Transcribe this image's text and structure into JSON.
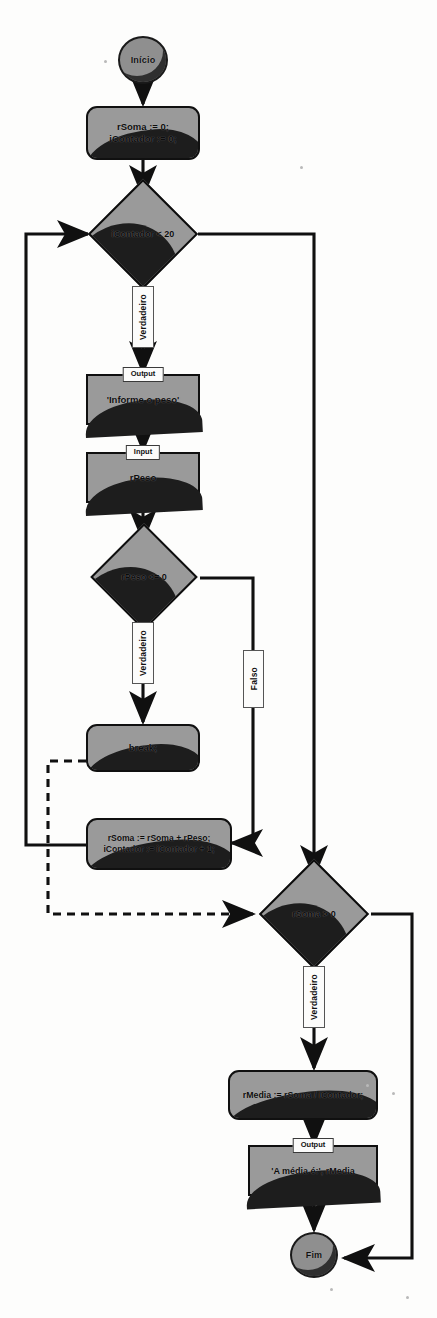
{
  "diagram": {
    "language": "pt-BR",
    "type": "flowchart",
    "colors": {
      "node_fill": "#9a9a9a",
      "node_shade": "#1d1d1d",
      "stroke": "#0d0d0d",
      "label_bg": "#fcfcfb",
      "background": "#fdfdfc"
    }
  },
  "nodes": [
    {
      "id": "start",
      "kind": "terminal",
      "label": "Início"
    },
    {
      "id": "init",
      "kind": "process",
      "label": "rSoma := 0;\niContador := 0;"
    },
    {
      "id": "dec_cont",
      "kind": "decision",
      "label": "iContador < 20"
    },
    {
      "id": "out_peso",
      "kind": "output",
      "caption": "Output",
      "label": "'Informe o peso'"
    },
    {
      "id": "in_peso",
      "kind": "input",
      "caption": "Input",
      "label": "rPeso"
    },
    {
      "id": "dec_peso",
      "kind": "decision",
      "label": "rPeso <= 0"
    },
    {
      "id": "brk",
      "kind": "process",
      "label": "break;"
    },
    {
      "id": "acc",
      "kind": "process",
      "label": "rSoma := rSoma + rPeso;\niContador := iContador + 1;"
    },
    {
      "id": "dec_soma",
      "kind": "decision",
      "label": "rSoma > 0"
    },
    {
      "id": "media",
      "kind": "process",
      "label": "rMedia := rSoma / iContador;"
    },
    {
      "id": "out_med",
      "kind": "output",
      "caption": "Output",
      "label": "'A média é:', rMedia"
    },
    {
      "id": "end",
      "kind": "terminal",
      "label": "Fim"
    }
  ],
  "edge_labels": [
    {
      "id": "lbl_v1",
      "text": "Verdadeiro",
      "from": "dec_cont"
    },
    {
      "id": "lbl_v2",
      "text": "Verdadeiro",
      "from": "dec_peso"
    },
    {
      "id": "lbl_f1",
      "text": "Falso",
      "from": "dec_peso"
    },
    {
      "id": "lbl_v3",
      "text": "Verdadeiro",
      "from": "dec_soma"
    }
  ],
  "edges": [
    {
      "from": "start",
      "to": "dec_cont",
      "style": "solid",
      "label": ""
    },
    {
      "from": "init",
      "to": "dec_cont",
      "style": "solid",
      "label": ""
    },
    {
      "from": "dec_cont",
      "to": "out_peso",
      "style": "solid",
      "label": "Verdadeiro"
    },
    {
      "from": "dec_cont",
      "to": "dec_soma",
      "style": "solid",
      "label": ""
    },
    {
      "from": "out_peso",
      "to": "in_peso",
      "style": "solid",
      "label": ""
    },
    {
      "from": "in_peso",
      "to": "dec_peso",
      "style": "solid",
      "label": ""
    },
    {
      "from": "dec_peso",
      "to": "brk",
      "style": "solid",
      "label": "Verdadeiro"
    },
    {
      "from": "dec_peso",
      "to": "acc",
      "style": "solid",
      "label": "Falso"
    },
    {
      "from": "brk",
      "to": "dec_soma",
      "style": "dashed",
      "label": ""
    },
    {
      "from": "acc",
      "to": "dec_cont",
      "style": "solid",
      "label": ""
    },
    {
      "from": "dec_soma",
      "to": "media",
      "style": "solid",
      "label": "Verdadeiro"
    },
    {
      "from": "dec_soma",
      "to": "end",
      "style": "solid",
      "label": ""
    },
    {
      "from": "media",
      "to": "out_med",
      "style": "solid",
      "label": ""
    },
    {
      "from": "out_med",
      "to": "end",
      "style": "solid",
      "label": ""
    }
  ]
}
